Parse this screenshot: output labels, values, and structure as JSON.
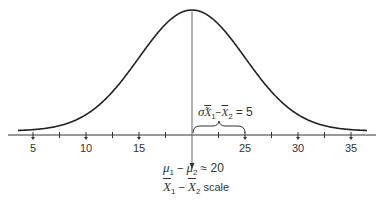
{
  "chart_data": {
    "type": "line",
    "title": "",
    "xlabel": "X̄1 − X̄2 scale",
    "ylabel": "",
    "x_ticks": [
      5,
      10,
      15,
      20,
      25,
      30,
      35
    ],
    "minor_ticks": [
      7.5,
      12.5,
      17.5,
      22.5,
      27.5,
      32.5
    ],
    "xlim": [
      3.5,
      37
    ],
    "mean": 20,
    "std_error": 5,
    "curve": "normal",
    "annotations": {
      "mean_label_lhs": "μ1 − μ2",
      "mean_label_rhs": "= 20",
      "scale_label": "X̄1 − X̄2 scale",
      "sigma_label": "σ̃ X̄1 − X̄2 = 5",
      "sigma_brace_range": [
        20,
        25
      ]
    },
    "grid": false,
    "legend": null
  },
  "labels": {
    "ticks": [
      "5",
      "10",
      "15",
      "20",
      "25",
      "30",
      "35"
    ],
    "mu_1": "μ",
    "mu_1_sub": "1",
    "minus": "−",
    "mu_2": "μ",
    "mu_2_sub": "2",
    "equals_20": "≈ 20",
    "x1": "X",
    "x1_sub": "1",
    "x2": "X",
    "x2_sub": "2",
    "scale": "scale",
    "sigma": "σ̃",
    "sigma_x1": "X",
    "sigma_x1_sub": "1",
    "sigma_x2": "X",
    "sigma_x2_sub": "2",
    "sigma_eq": "= 5"
  },
  "colors": {
    "curve": "#222222",
    "axis": "#333333",
    "mean_line": "#555555"
  }
}
